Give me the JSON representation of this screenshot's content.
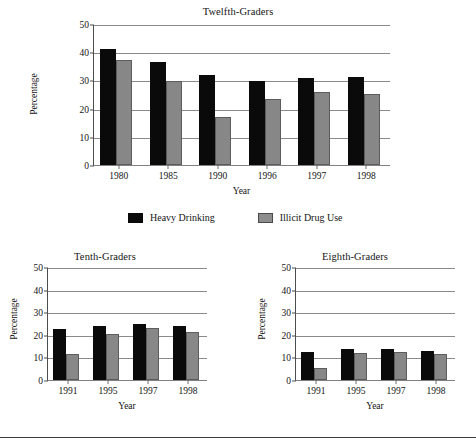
{
  "legend": {
    "position": "below-top-chart",
    "entries": [
      {
        "label": "Heavy Drinking",
        "color": "#0a0a0a",
        "key": "heavy_drinking"
      },
      {
        "label": "Illicit Drug Use",
        "color": "#878787",
        "key": "illicit_drug_use"
      }
    ]
  },
  "chart_data": [
    {
      "id": "twelfth-graders",
      "type": "bar",
      "title": "Twelfth-Graders",
      "xlabel": "Year",
      "ylabel": "Percentage",
      "categories": [
        "1980",
        "1985",
        "1990",
        "1996",
        "1997",
        "1998"
      ],
      "yticks": [
        0,
        10,
        20,
        30,
        40,
        50
      ],
      "ylim": [
        0,
        50
      ],
      "grid": true,
      "legend": "bottom",
      "series": [
        {
          "name": "Heavy Drinking",
          "color": "#0a0a0a",
          "values": [
            41.2,
            36.7,
            31.8,
            29.8,
            31.0,
            31.1
          ]
        },
        {
          "name": "Illicit Drug Use",
          "color": "#878787",
          "values": [
            37.2,
            29.7,
            17.2,
            23.5,
            25.9,
            25.3
          ]
        }
      ]
    },
    {
      "id": "tenth-graders",
      "type": "bar",
      "title": "Tenth-Graders",
      "xlabel": "Year",
      "ylabel": "Percentage",
      "categories": [
        "1991",
        "1995",
        "1997",
        "1998"
      ],
      "yticks": [
        0,
        10,
        20,
        30,
        40,
        50
      ],
      "ylim": [
        0,
        50
      ],
      "grid": true,
      "series": [
        {
          "name": "Heavy Drinking",
          "color": "#0a0a0a",
          "values": [
            22.5,
            23.8,
            24.9,
            24.0
          ]
        },
        {
          "name": "Illicit Drug Use",
          "color": "#878787",
          "values": [
            11.6,
            20.5,
            22.9,
            21.4
          ]
        }
      ]
    },
    {
      "id": "eighth-graders",
      "type": "bar",
      "title": "Eighth-Graders",
      "xlabel": "Year",
      "ylabel": "Percentage",
      "categories": [
        "1991",
        "1995",
        "1997",
        "1998"
      ],
      "yticks": [
        0,
        10,
        20,
        30,
        40,
        50
      ],
      "ylim": [
        0,
        50
      ],
      "grid": true,
      "series": [
        {
          "name": "Heavy Drinking",
          "color": "#0a0a0a",
          "values": [
            12.4,
            13.9,
            13.9,
            12.9
          ]
        },
        {
          "name": "Illicit Drug Use",
          "color": "#878787",
          "values": [
            5.3,
            11.8,
            12.4,
            11.4
          ]
        }
      ]
    }
  ]
}
